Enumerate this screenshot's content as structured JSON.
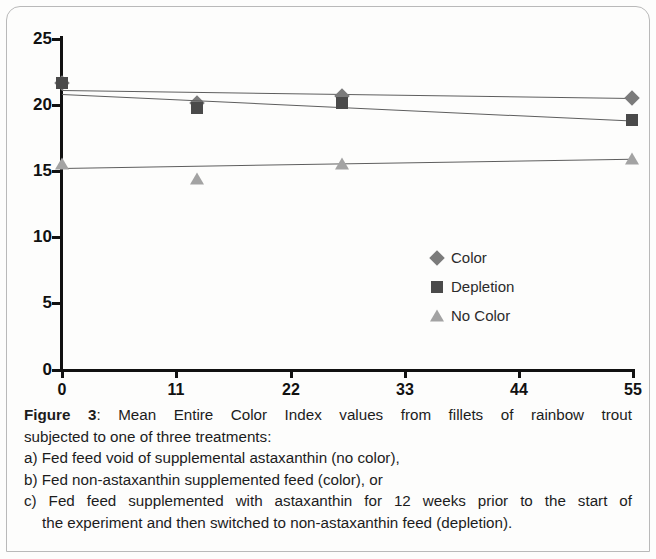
{
  "figure": {
    "label": "Figure 3",
    "label_sep": ":",
    "caption_line1": "Mean Entire Color Index values from fillets of rainbow trout",
    "caption_line2": "subjected to one of three treatments:",
    "caption_line3": "a) Fed feed void of supplemental astaxanthin (no color),",
    "caption_line4": "b) Fed non-astaxanthin supplemented feed (color), or",
    "caption_line5": "c) Fed feed supplemented with astaxanthin for 12 weeks prior to the start of",
    "caption_line6": "the experiment and then switched to non-astaxanthin feed (depletion)."
  },
  "legend": {
    "items": [
      {
        "label": "Color",
        "marker": "diamond-marker-icon",
        "color": "#7b7b7b"
      },
      {
        "label": "Depletion",
        "marker": "square-marker-icon",
        "color": "#4a4a4a"
      },
      {
        "label": "No Color",
        "marker": "triangle-marker-icon",
        "color": "#a3a3a3"
      }
    ]
  },
  "axes": {
    "y_ticks": [
      "0",
      "5",
      "10",
      "15",
      "20",
      "25"
    ],
    "x_ticks": [
      "0",
      "11",
      "22",
      "33",
      "44",
      "55"
    ]
  },
  "chart_data": {
    "type": "scatter",
    "title": "",
    "xlabel": "",
    "ylabel": "",
    "xlim": [
      0,
      55
    ],
    "ylim": [
      0,
      25
    ],
    "xticks": [
      0,
      11,
      22,
      33,
      44,
      55
    ],
    "yticks": [
      0,
      5,
      10,
      15,
      20,
      25
    ],
    "grid": false,
    "legend_position": "center-right",
    "series": [
      {
        "name": "Color",
        "marker": "diamond",
        "color": "#7b7b7b",
        "x": [
          0,
          13,
          27,
          55
        ],
        "y": [
          21.6,
          20.1,
          20.6,
          20.5
        ],
        "trendline": {
          "x": [
            0,
            55
          ],
          "y": [
            21.1,
            20.5
          ]
        }
      },
      {
        "name": "Depletion",
        "marker": "square",
        "color": "#4a4a4a",
        "x": [
          0,
          13,
          27,
          55
        ],
        "y": [
          21.6,
          19.7,
          20.1,
          18.8
        ],
        "trendline": {
          "x": [
            0,
            55
          ],
          "y": [
            20.8,
            18.8
          ]
        }
      },
      {
        "name": "No Color",
        "marker": "triangle",
        "color": "#a3a3a3",
        "x": [
          0,
          13,
          27,
          55
        ],
        "y": [
          15.5,
          14.4,
          15.5,
          15.9
        ],
        "trendline": {
          "x": [
            0,
            55
          ],
          "y": [
            15.2,
            15.9
          ]
        }
      }
    ]
  }
}
